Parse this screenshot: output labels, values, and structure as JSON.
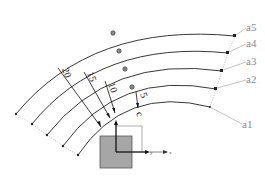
{
  "diagram": {
    "type": "concentric-arc-paths",
    "arcs": [
      {
        "id": "a1",
        "label": "a1",
        "offset": 0
      },
      {
        "id": "a2",
        "label": "a2",
        "offset": 5
      },
      {
        "id": "a3",
        "label": "a3",
        "offset": 10
      },
      {
        "id": "a4",
        "label": "a4",
        "offset": 15
      },
      {
        "id": "a5",
        "label": "a5",
        "offset": 20
      }
    ],
    "dimensions": [
      {
        "label": "5"
      },
      {
        "label": "10"
      },
      {
        "label": "15"
      },
      {
        "label": "20"
      }
    ],
    "origin_marker": "c",
    "axes": {
      "x_label": "x",
      "y_label": "y"
    },
    "colors": {
      "line": "#222222",
      "leader": "#9a9a9a",
      "block_fill": "#a6a6a6",
      "block_stroke": "#555555"
    }
  }
}
